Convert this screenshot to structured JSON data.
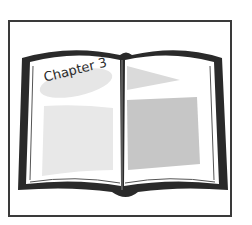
{
  "illustration": {
    "subject": "open-book",
    "chapter_label": "Chapter 3"
  },
  "colors": {
    "frame": "#3a3a3a",
    "book_outline": "#2a2a2a",
    "page": "#ffffff",
    "label_bg": "#e6e6e6",
    "left_block": "#e8e8e8",
    "right_block": "#c6c6c6",
    "right_triangle": "#dadada"
  }
}
